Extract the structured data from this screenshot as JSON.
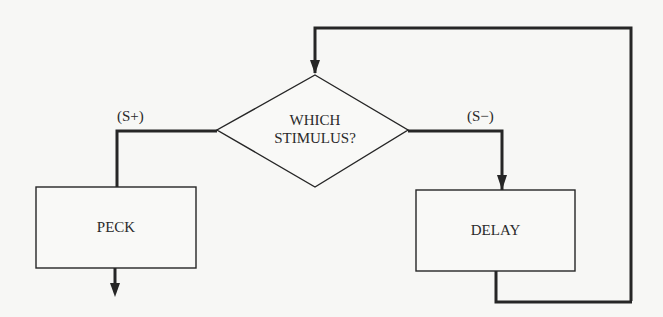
{
  "diagram": {
    "type": "flowchart",
    "decision": {
      "line1": "WHICH",
      "line2": "STIMULUS?"
    },
    "branches": {
      "left_label": "(S+)",
      "right_label": "(S−)"
    },
    "boxes": {
      "left": "PECK",
      "right": "DELAY"
    },
    "colors": {
      "line": "#262626",
      "background": "#f7f7f5",
      "box_fill": "#f9f9f7"
    }
  }
}
